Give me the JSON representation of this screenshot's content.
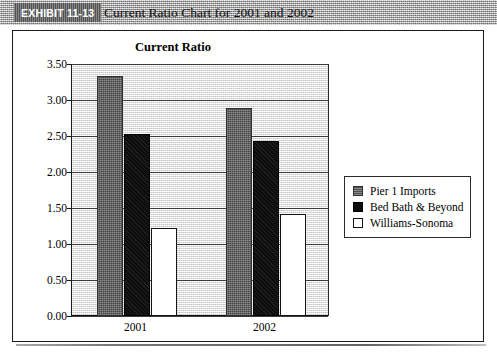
{
  "header": {
    "exhibit_label": "EXHIBIT 11-13",
    "title": "Current Ratio Chart for 2001 and 2002",
    "band_color": "#b4b4b4",
    "tab_color": "#6d6d6d"
  },
  "chart_data": {
    "type": "bar",
    "title": "Current Ratio",
    "xlabel": "",
    "ylabel": "",
    "categories": [
      "2001",
      "2002"
    ],
    "series": [
      {
        "name": "Pier 1 Imports",
        "values": [
          3.33,
          2.89
        ],
        "color": "#6e6e6e"
      },
      {
        "name": "Bed Bath & Beyond",
        "values": [
          2.53,
          2.43
        ],
        "color": "#0d0d0d"
      },
      {
        "name": "Williams-Sonoma",
        "values": [
          1.22,
          1.41
        ],
        "color": "#ffffff"
      }
    ],
    "ylim": [
      0.0,
      3.5
    ],
    "ytick_step": 0.5,
    "ytick_labels": [
      "0.00",
      "0.50",
      "1.00",
      "1.50",
      "2.00",
      "2.50",
      "3.00",
      "3.50"
    ],
    "grid": true,
    "legend_position": "right"
  }
}
